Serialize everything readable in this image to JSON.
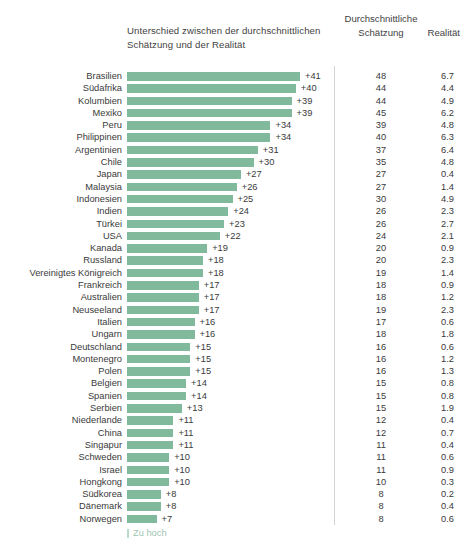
{
  "header": {
    "diff_title": "Unterschied zwischen der durchschnittlichen Schätzung und der Realität",
    "estimate_title_line1": "Durchschnittliche",
    "estimate_title_line2": "Schätzung",
    "reality_title": "Realität"
  },
  "legend": {
    "label": "Zu hoch",
    "swatch_color": "#b9dcca"
  },
  "colors": {
    "bar": "#80b99c",
    "divider": "#d4d4d4",
    "text": "#3a3a3a",
    "legend_text": "#9ec4b0"
  },
  "chart_data": {
    "type": "bar",
    "title": "Unterschied zwischen der durchschnittlichen Schätzung und der Realität",
    "xlabel": "",
    "ylabel": "",
    "orientation": "horizontal",
    "grid": false,
    "legend": [
      "Zu hoch"
    ],
    "legend_position": "bottom-left",
    "xlim": [
      0,
      41
    ],
    "px_per_unit": 4.22,
    "value_columns": [
      "Unterschied",
      "Durchschnittliche Schätzung",
      "Realität"
    ],
    "categories": [
      "Brasilien",
      "Südafrika",
      "Kolumbien",
      "Mexiko",
      "Peru",
      "Philippinen",
      "Argentinien",
      "Chile",
      "Japan",
      "Malaysia",
      "Indonesien",
      "Indien",
      "Türkei",
      "USA",
      "Kanada",
      "Russland",
      "Vereinigtes Königreich",
      "Frankreich",
      "Australien",
      "Neuseeland",
      "Italien",
      "Ungarn",
      "Deutschland",
      "Montenegro",
      "Polen",
      "Belgien",
      "Spanien",
      "Serbien",
      "Niederlande",
      "China",
      "Singapur",
      "Schweden",
      "Israel",
      "Hongkong",
      "Südkorea",
      "Dänemark",
      "Norwegen"
    ],
    "values": [
      41,
      40,
      39,
      39,
      34,
      34,
      31,
      30,
      27,
      26,
      25,
      24,
      23,
      22,
      19,
      18,
      18,
      17,
      17,
      17,
      16,
      16,
      15,
      15,
      15,
      14,
      14,
      13,
      11,
      11,
      11,
      10,
      10,
      10,
      8,
      8,
      7
    ],
    "series": [
      {
        "name": "Durchschnittliche Schätzung",
        "values": [
          48,
          44,
          44,
          45,
          39,
          40,
          37,
          35,
          27,
          27,
          30,
          26,
          26,
          24,
          20,
          20,
          19,
          18,
          18,
          19,
          17,
          18,
          16,
          16,
          16,
          15,
          15,
          15,
          12,
          12,
          11,
          11,
          11,
          10,
          8,
          8,
          8
        ]
      },
      {
        "name": "Realität",
        "values": [
          6.7,
          4.4,
          4.9,
          6.2,
          4.8,
          6.3,
          6.4,
          4.8,
          0.4,
          1.4,
          4.9,
          2.3,
          2.7,
          2.1,
          0.9,
          2.3,
          1.4,
          0.9,
          1.2,
          2.3,
          0.6,
          1.8,
          0.6,
          1.2,
          1.3,
          0.8,
          0.8,
          1.9,
          0.4,
          0.7,
          0.4,
          0.6,
          0.9,
          0.3,
          0.2,
          0.4,
          0.6
        ]
      }
    ]
  },
  "rows": [
    {
      "label": "Brasilien",
      "diff": "+41",
      "value": 41,
      "est": "48",
      "real": "6.7"
    },
    {
      "label": "Südafrika",
      "diff": "+40",
      "value": 40,
      "est": "44",
      "real": "4.4"
    },
    {
      "label": "Kolumbien",
      "diff": "+39",
      "value": 39,
      "est": "44",
      "real": "4.9"
    },
    {
      "label": "Mexiko",
      "diff": "+39",
      "value": 39,
      "est": "45",
      "real": "6.2"
    },
    {
      "label": "Peru",
      "diff": "+34",
      "value": 34,
      "est": "39",
      "real": "4.8"
    },
    {
      "label": "Philippinen",
      "diff": "+34",
      "value": 34,
      "est": "40",
      "real": "6.3"
    },
    {
      "label": "Argentinien",
      "diff": "+31",
      "value": 31,
      "est": "37",
      "real": "6.4"
    },
    {
      "label": "Chile",
      "diff": "+30",
      "value": 30,
      "est": "35",
      "real": "4.8"
    },
    {
      "label": "Japan",
      "diff": "+27",
      "value": 27,
      "est": "27",
      "real": "0.4"
    },
    {
      "label": "Malaysia",
      "diff": "+26",
      "value": 26,
      "est": "27",
      "real": "1.4"
    },
    {
      "label": "Indonesien",
      "diff": "+25",
      "value": 25,
      "est": "30",
      "real": "4.9"
    },
    {
      "label": "Indien",
      "diff": "+24",
      "value": 24,
      "est": "26",
      "real": "2.3"
    },
    {
      "label": "Türkei",
      "diff": "+23",
      "value": 23,
      "est": "26",
      "real": "2.7"
    },
    {
      "label": "USA",
      "diff": "+22",
      "value": 22,
      "est": "24",
      "real": "2.1"
    },
    {
      "label": "Kanada",
      "diff": "+19",
      "value": 19,
      "est": "20",
      "real": "0.9"
    },
    {
      "label": "Russland",
      "diff": "+18",
      "value": 18,
      "est": "20",
      "real": "2.3"
    },
    {
      "label": "Vereinigtes Königreich",
      "diff": "+18",
      "value": 18,
      "est": "19",
      "real": "1.4"
    },
    {
      "label": "Frankreich",
      "diff": "+17",
      "value": 17,
      "est": "18",
      "real": "0.9"
    },
    {
      "label": "Australien",
      "diff": "+17",
      "value": 17,
      "est": "18",
      "real": "1.2"
    },
    {
      "label": "Neuseeland",
      "diff": "+17",
      "value": 17,
      "est": "19",
      "real": "2.3"
    },
    {
      "label": "Italien",
      "diff": "+16",
      "value": 16,
      "est": "17",
      "real": "0.6"
    },
    {
      "label": "Ungarn",
      "diff": "+16",
      "value": 16,
      "est": "18",
      "real": "1.8"
    },
    {
      "label": "Deutschland",
      "diff": "+15",
      "value": 15,
      "est": "16",
      "real": "0.6"
    },
    {
      "label": "Montenegro",
      "diff": "+15",
      "value": 15,
      "est": "16",
      "real": "1.2"
    },
    {
      "label": "Polen",
      "diff": "+15",
      "value": 15,
      "est": "16",
      "real": "1.3"
    },
    {
      "label": "Belgien",
      "diff": "+14",
      "value": 14,
      "est": "15",
      "real": "0.8"
    },
    {
      "label": "Spanien",
      "diff": "+14",
      "value": 14,
      "est": "15",
      "real": "0.8"
    },
    {
      "label": "Serbien",
      "diff": "+13",
      "value": 13,
      "est": "15",
      "real": "1.9"
    },
    {
      "label": "Niederlande",
      "diff": "+11",
      "value": 11,
      "est": "12",
      "real": "0.4"
    },
    {
      "label": "China",
      "diff": "+11",
      "value": 11,
      "est": "12",
      "real": "0.7"
    },
    {
      "label": "Singapur",
      "diff": "+11",
      "value": 11,
      "est": "11",
      "real": "0.4"
    },
    {
      "label": "Schweden",
      "diff": "+10",
      "value": 10,
      "est": "11",
      "real": "0.6"
    },
    {
      "label": "Israel",
      "diff": "+10",
      "value": 10,
      "est": "11",
      "real": "0.9"
    },
    {
      "label": "Hongkong",
      "diff": "+10",
      "value": 10,
      "est": "10",
      "real": "0.3"
    },
    {
      "label": "Südkorea",
      "diff": "+8",
      "value": 8,
      "est": "8",
      "real": "0.2"
    },
    {
      "label": "Dänemark",
      "diff": "+8",
      "value": 8,
      "est": "8",
      "real": "0.4"
    },
    {
      "label": "Norwegen",
      "diff": "+7",
      "value": 7,
      "est": "8",
      "real": "0.6"
    }
  ]
}
